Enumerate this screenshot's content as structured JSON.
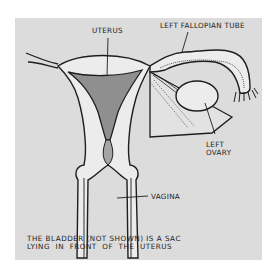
{
  "diagram": {
    "type": "anatomical-illustration",
    "colors": {
      "background": "#ffffff",
      "panel": "#dcdcdc",
      "outline": "#1e1e1e",
      "uterine_cavity": "#8f8f8f",
      "organ_fill": "#ececec"
    },
    "labels": {
      "uterus": "UTERUS",
      "left_fallopian_tube": "LEFT FALLOPIAN TUBE",
      "left_ovary_line1": "LEFT",
      "left_ovary_line2": "OVARY",
      "vagina": "VAGINA"
    },
    "caption": {
      "line1": "THE BLADDER (NOT SHOWN) IS A SAC",
      "line2": "LYING  IN  FRONT  OF  THE  UTERUS"
    }
  }
}
